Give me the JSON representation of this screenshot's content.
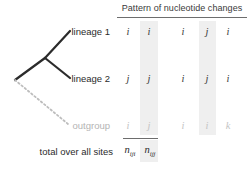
{
  "figure": {
    "header": {
      "title": "Pattern of nucleotide changes"
    },
    "tree": {
      "labels": {
        "lineage1": "lineage 1",
        "lineage2": "lineage 2",
        "outgroup": "outgroup"
      },
      "colors": {
        "branch": "#2b2b2b",
        "outgroup_branch": "#bdbdbd",
        "outgroup_label": "#b4b4b4"
      }
    },
    "matrix": {
      "columns": [
        {
          "id": "col1",
          "shaded": false
        },
        {
          "id": "col2",
          "shaded": true
        },
        {
          "id": "col3",
          "shaded": false
        },
        {
          "id": "col4",
          "shaded": true
        },
        {
          "id": "col5",
          "shaded": false
        }
      ],
      "rows": [
        {
          "id": "lineage1",
          "values": [
            "i",
            "i",
            "i",
            "j",
            "i"
          ],
          "faded": false
        },
        {
          "id": "lineage2",
          "values": [
            "j",
            "j",
            "i",
            "j",
            "i"
          ],
          "faded": false
        },
        {
          "id": "outgroup",
          "values": [
            "i",
            "j",
            "i",
            "i",
            "k"
          ],
          "faded": true
        }
      ]
    },
    "totals": {
      "label": "total over all sites",
      "cells": [
        {
          "symbol": "n",
          "subscript": "iji"
        },
        {
          "symbol": "n",
          "subscript": "ijj"
        }
      ]
    },
    "colors": {
      "shade": "#efefef",
      "rule": "#6d6d6d",
      "text": "#2b2b2b"
    }
  }
}
